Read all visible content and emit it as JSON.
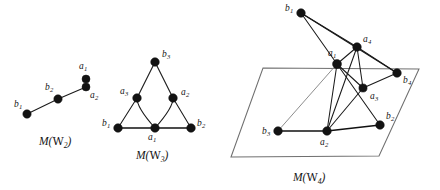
{
  "figure": {
    "width": 440,
    "height": 190,
    "background": "#ffffff",
    "ink_color": "#131313",
    "hidden_edge_color": "#8d8d8d",
    "plane_color": "#6f6f6f"
  },
  "graphs": [
    {
      "id": "m-w2",
      "caption_prefix": "M(",
      "caption_symbol": "W",
      "caption_sub": "2",
      "caption_suffix": ")",
      "caption_text": "M(W2)",
      "caption_pos": {
        "x": 39,
        "y": 136
      },
      "nodes": [
        {
          "id": "b1",
          "letter": "b",
          "sub": "1",
          "x": 27,
          "y": 114,
          "r": 4.2,
          "label_x": 14,
          "label_y": 100
        },
        {
          "id": "b2",
          "letter": "b",
          "sub": "2",
          "x": 58,
          "y": 99,
          "r": 4.2,
          "label_x": 45,
          "label_y": 83
        },
        {
          "id": "a1",
          "letter": "a",
          "sub": "1",
          "x": 86,
          "y": 79,
          "r": 4.0,
          "label_x": 79,
          "label_y": 62
        },
        {
          "id": "a2",
          "letter": "a",
          "sub": "2",
          "x": 86,
          "y": 87,
          "r": 4.0,
          "label_x": 90,
          "label_y": 91
        }
      ],
      "edges": [
        {
          "from": "b1",
          "to": "b2",
          "kind": "straight"
        },
        {
          "from": "b2",
          "to": "a2",
          "kind": "straight"
        }
      ]
    },
    {
      "id": "m-w3",
      "caption_prefix": "M(",
      "caption_symbol": "W",
      "caption_sub": "3",
      "caption_suffix": ")",
      "caption_text": "M(W3)",
      "caption_pos": {
        "x": 136,
        "y": 150
      },
      "nodes": [
        {
          "id": "b3",
          "letter": "b",
          "sub": "3",
          "x": 155,
          "y": 62,
          "r": 4.3,
          "label_x": 162,
          "label_y": 50
        },
        {
          "id": "a3",
          "letter": "a",
          "sub": "3",
          "x": 137,
          "y": 98,
          "r": 4.3,
          "label_x": 120,
          "label_y": 87
        },
        {
          "id": "a2",
          "letter": "a",
          "sub": "2",
          "x": 173,
          "y": 98,
          "r": 4.3,
          "label_x": 181,
          "label_y": 88
        },
        {
          "id": "b1",
          "letter": "b",
          "sub": "1",
          "x": 118,
          "y": 128,
          "r": 4.3,
          "label_x": 102,
          "label_y": 119
        },
        {
          "id": "a1",
          "letter": "a",
          "sub": "1",
          "x": 155,
          "y": 128,
          "r": 4.3,
          "label_x": 148,
          "label_y": 133
        },
        {
          "id": "b2",
          "letter": "b",
          "sub": "2",
          "x": 191,
          "y": 128,
          "r": 4.3,
          "label_x": 197,
          "label_y": 119
        }
      ],
      "edges": [
        {
          "from": "b3",
          "to": "a3",
          "kind": "straight"
        },
        {
          "from": "b3",
          "to": "a2",
          "kind": "straight"
        },
        {
          "from": "a3",
          "to": "b1",
          "kind": "straight"
        },
        {
          "from": "a2",
          "to": "b2",
          "kind": "straight"
        },
        {
          "from": "b1",
          "to": "b2",
          "kind": "thick"
        },
        {
          "from": "a3",
          "to": "a1",
          "kind": "curve"
        },
        {
          "from": "a2",
          "to": "a1",
          "kind": "curve"
        }
      ]
    },
    {
      "id": "m-w4",
      "caption_prefix": "M(",
      "caption_symbol": "W",
      "caption_sub": "4",
      "caption_suffix": ")",
      "caption_text": "M(W4)",
      "caption_pos": {
        "x": 293,
        "y": 172
      },
      "plane": [
        {
          "x": 263,
          "y": 68
        },
        {
          "x": 419,
          "y": 69
        },
        {
          "x": 379,
          "y": 156
        },
        {
          "x": 231,
          "y": 157
        }
      ],
      "nodes": [
        {
          "id": "b1",
          "letter": "b",
          "sub": "1",
          "x": 301,
          "y": 13,
          "r": 4.3,
          "label_x": 285,
          "label_y": 4
        },
        {
          "id": "a4",
          "letter": "a",
          "sub": "4",
          "x": 357,
          "y": 47,
          "r": 4.3,
          "label_x": 363,
          "label_y": 35
        },
        {
          "id": "a1",
          "letter": "a",
          "sub": "1",
          "x": 337,
          "y": 64,
          "r": 4.5,
          "label_x": 328,
          "label_y": 49
        },
        {
          "id": "b4",
          "letter": "b",
          "sub": "4",
          "x": 397,
          "y": 73,
          "r": 4.3,
          "label_x": 403,
          "label_y": 76
        },
        {
          "id": "a3",
          "letter": "a",
          "sub": "3",
          "x": 363,
          "y": 88,
          "r": 4.1,
          "label_x": 370,
          "label_y": 92
        },
        {
          "id": "b3",
          "letter": "b",
          "sub": "3",
          "x": 278,
          "y": 131,
          "r": 4.3,
          "label_x": 262,
          "label_y": 127
        },
        {
          "id": "a2",
          "letter": "a",
          "sub": "2",
          "x": 327,
          "y": 131,
          "r": 4.3,
          "label_x": 320,
          "label_y": 138
        },
        {
          "id": "b2",
          "letter": "b",
          "sub": "2",
          "x": 380,
          "y": 125,
          "r": 4.3,
          "label_x": 386,
          "label_y": 112
        }
      ],
      "edges": [
        {
          "from": "b1",
          "to": "a1",
          "kind": "straight"
        },
        {
          "from": "b1",
          "to": "a4",
          "kind": "straight"
        },
        {
          "from": "b1",
          "to": "b4",
          "kind": "straight"
        },
        {
          "from": "a1",
          "to": "a4",
          "kind": "straight"
        },
        {
          "from": "a1",
          "to": "a3",
          "kind": "straight"
        },
        {
          "from": "a4",
          "to": "a3",
          "kind": "straight"
        },
        {
          "from": "a4",
          "to": "b4",
          "kind": "straight"
        },
        {
          "from": "a3",
          "to": "b4",
          "kind": "straight"
        },
        {
          "from": "a1",
          "to": "a2",
          "kind": "straight"
        },
        {
          "from": "a1",
          "to": "b2",
          "kind": "straight"
        },
        {
          "from": "a1",
          "to": "b3",
          "kind": "hidden"
        },
        {
          "from": "a2",
          "to": "a3",
          "kind": "straight"
        },
        {
          "from": "a2",
          "to": "a4",
          "kind": "straight"
        },
        {
          "from": "a2",
          "to": "b3",
          "kind": "thick"
        },
        {
          "from": "a2",
          "to": "b2",
          "kind": "thick"
        }
      ]
    }
  ]
}
